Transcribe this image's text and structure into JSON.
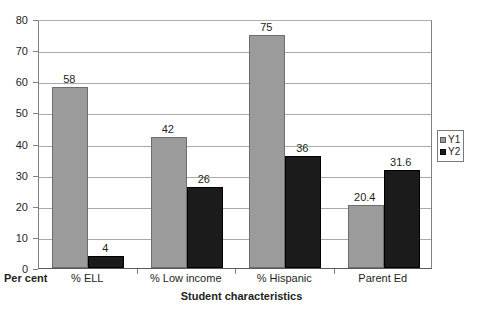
{
  "chart_data": {
    "type": "bar",
    "title": "",
    "subtitle": "",
    "xlabel": "Student characteristics",
    "ylabel": "Per cent",
    "categories": [
      "% ELL",
      "% Low income",
      "% Hispanic",
      "Parent Ed"
    ],
    "series": [
      {
        "name": "Y1",
        "color": "#9b9b9b",
        "values": [
          58,
          42,
          75,
          20.4
        ],
        "labels": [
          "58",
          "42",
          "75",
          "20.4"
        ]
      },
      {
        "name": "Y2",
        "color": "#1b1b1b",
        "values": [
          4,
          26,
          36,
          31.6
        ],
        "labels": [
          "4",
          "26",
          "36",
          "31.6"
        ]
      }
    ],
    "ylim": [
      0,
      80
    ],
    "ytick_step": 10,
    "ytick_labels": [
      "80",
      "70",
      "60",
      "50",
      "40",
      "30",
      "20",
      "10",
      "0"
    ],
    "ytick_values": [
      80,
      70,
      60,
      50,
      40,
      30,
      20,
      10,
      0
    ],
    "grid": true,
    "grid_axis": "y",
    "legend_position": "right",
    "data_labels": true
  },
  "axis": {
    "y_corner_label": "Per cent",
    "x_title": "Student characteristics"
  },
  "legend": {
    "entries": [
      {
        "label": "Y1",
        "swatch": "legend-swatch-y1"
      },
      {
        "label": "Y2",
        "swatch": "legend-swatch-y2"
      }
    ]
  },
  "colors": {
    "series_y1": "#9b9b9b",
    "series_y2": "#1b1b1b",
    "gridline": "#a9a9a9",
    "axis": "#808080",
    "text": "#231f20",
    "background": "#ffffff"
  }
}
